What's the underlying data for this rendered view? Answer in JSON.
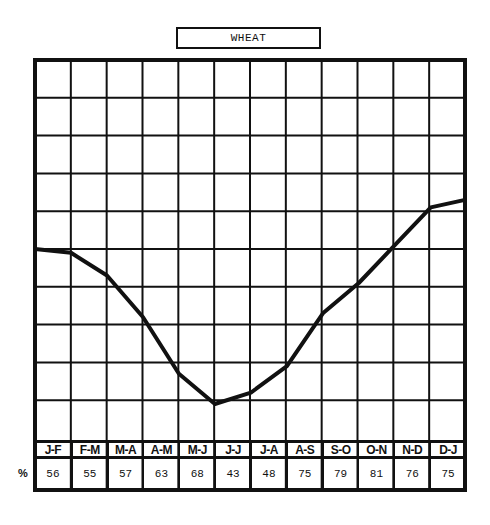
{
  "title": "WHEAT",
  "row_label": "%",
  "chart_data": {
    "type": "line",
    "title": "WHEAT",
    "xlabel": "",
    "ylabel": "%",
    "categories": [
      "J-F",
      "F-M",
      "M-A",
      "A-M",
      "M-J",
      "J-J",
      "J-A",
      "A-S",
      "S-O",
      "O-N",
      "N-D",
      "D-J"
    ],
    "table_values": [
      56,
      55,
      57,
      63,
      68,
      43,
      48,
      75,
      79,
      81,
      76,
      75
    ],
    "line_points_normalized": [
      {
        "x": 0.0,
        "y": 0.5
      },
      {
        "x": 1.0,
        "y": 0.49
      },
      {
        "x": 2.0,
        "y": 0.43
      },
      {
        "x": 3.0,
        "y": 0.32
      },
      {
        "x": 4.0,
        "y": 0.17
      },
      {
        "x": 5.0,
        "y": 0.09
      },
      {
        "x": 6.0,
        "y": 0.12
      },
      {
        "x": 7.0,
        "y": 0.19
      },
      {
        "x": 8.0,
        "y": 0.33
      },
      {
        "x": 9.0,
        "y": 0.41
      },
      {
        "x": 10.0,
        "y": 0.51
      },
      {
        "x": 11.0,
        "y": 0.61
      },
      {
        "x": 11.95,
        "y": 0.63
      }
    ],
    "grid": true,
    "grid_columns": 12,
    "grid_rows": 10,
    "ylim": [
      0,
      1
    ],
    "legend": null
  },
  "colors": {
    "ink": "#111111",
    "background": "#ffffff"
  }
}
